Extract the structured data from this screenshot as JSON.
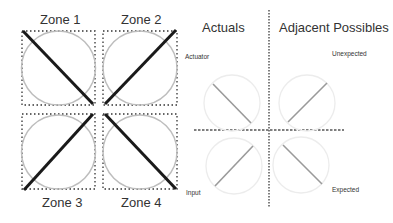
{
  "zones": {
    "zone1": "Zone 1",
    "zone2": "Zone 2",
    "zone3": "Zone 3",
    "zone4": "Zone 4"
  },
  "headings": {
    "actuals": "Actuals",
    "adjacent_possibles": "Adjacent Possibles"
  },
  "quadrant_labels": {
    "actuator": "Actuator",
    "unexpected": "Unexpected",
    "input": "Input",
    "expected": "Expected"
  },
  "colors": {
    "thick_line": "#1a1a1a",
    "circle_gray": "#bdbdbd",
    "faint_circle": "#ececec",
    "thin_line": "#9a9a9a",
    "dotted": "#333333"
  }
}
